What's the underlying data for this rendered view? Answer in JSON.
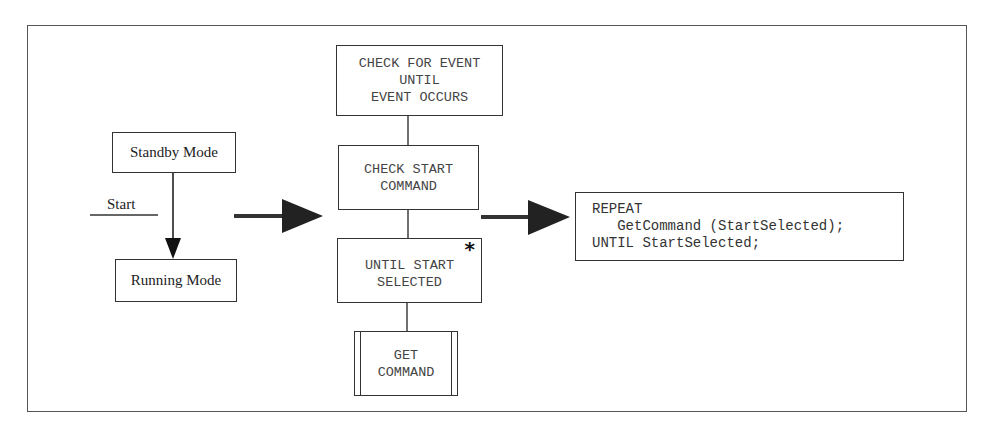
{
  "state_diagram": {
    "states": [
      {
        "label": "Standby Mode"
      },
      {
        "label": "Running Mode"
      }
    ],
    "transition": {
      "label": "Start"
    }
  },
  "structure_chart": {
    "nodes": [
      {
        "lines": [
          "CHECK FOR EVENT",
          "UNTIL",
          "EVENT OCCURS"
        ]
      },
      {
        "lines": [
          "CHECK START",
          "COMMAND"
        ]
      },
      {
        "lines": [
          "UNTIL START",
          "SELECTED"
        ],
        "marker": "*"
      },
      {
        "lines": [
          "GET",
          "COMMAND"
        ],
        "type": "predefined-process"
      }
    ]
  },
  "code": {
    "lines": [
      "REPEAT",
      "   GetCommand (StartSelected);",
      "UNTIL StartSelected;"
    ]
  }
}
